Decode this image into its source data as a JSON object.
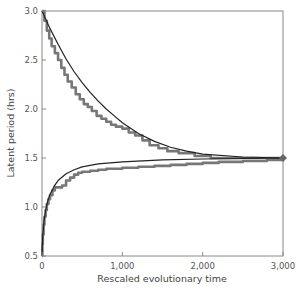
{
  "chart_data": {
    "type": "line",
    "title": "",
    "xlabel": "Rescaled evolutionary time",
    "ylabel": "Latent period (hrs)",
    "xlim": [
      0,
      3000
    ],
    "ylim": [
      0.5,
      3.0
    ],
    "grid": false,
    "legend": null,
    "x_ticks": [
      0,
      1000,
      2000,
      3000
    ],
    "x_tick_labels": [
      "0",
      "1,000",
      "2,000",
      "3,000"
    ],
    "y_ticks": [
      0.5,
      1.0,
      1.5,
      2.0,
      2.5,
      3.0
    ],
    "y_tick_labels": [
      "0.5",
      "1.0",
      "1.5",
      "2.0",
      "2.5",
      "3.0"
    ],
    "series": [
      {
        "name": "Simulation (decreasing from 3.0)",
        "style": "step",
        "color": "#777777",
        "x": [
          0,
          30,
          60,
          90,
          120,
          160,
          200,
          240,
          280,
          320,
          370,
          420,
          470,
          520,
          570,
          620,
          680,
          740,
          800,
          860,
          920,
          1000,
          1080,
          1160,
          1250,
          1340,
          1450,
          1560,
          1700,
          1900,
          2100,
          2400,
          2700,
          3000
        ],
        "y": [
          3.0,
          2.9,
          2.8,
          2.72,
          2.64,
          2.57,
          2.5,
          2.42,
          2.35,
          2.28,
          2.22,
          2.15,
          2.1,
          2.05,
          2.02,
          1.98,
          1.93,
          1.9,
          1.87,
          1.84,
          1.82,
          1.8,
          1.76,
          1.73,
          1.68,
          1.63,
          1.6,
          1.57,
          1.55,
          1.52,
          1.5,
          1.5,
          1.5,
          1.5
        ]
      },
      {
        "name": "Theory (decreasing)",
        "style": "smooth",
        "color": "#222222",
        "x": [
          0,
          100,
          200,
          300,
          400,
          500,
          600,
          700,
          800,
          900,
          1000,
          1200,
          1400,
          1600,
          1800,
          2000,
          2500,
          3000
        ],
        "y": [
          3.0,
          2.82,
          2.66,
          2.51,
          2.38,
          2.27,
          2.17,
          2.08,
          2.0,
          1.93,
          1.86,
          1.75,
          1.67,
          1.61,
          1.57,
          1.54,
          1.51,
          1.5
        ]
      },
      {
        "name": "Simulation (increasing from 0.5)",
        "style": "step",
        "color": "#777777",
        "x": [
          0,
          5,
          10,
          20,
          30,
          45,
          60,
          80,
          100,
          130,
          160,
          200,
          250,
          300,
          350,
          400,
          450,
          500,
          600,
          700,
          800,
          1000,
          1200,
          1400,
          1600,
          1800,
          2000,
          2200,
          2500,
          2800,
          3000
        ],
        "y": [
          0.5,
          0.62,
          0.72,
          0.82,
          0.9,
          0.97,
          1.03,
          1.08,
          1.12,
          1.17,
          1.2,
          1.2,
          1.22,
          1.27,
          1.3,
          1.33,
          1.35,
          1.36,
          1.37,
          1.38,
          1.39,
          1.4,
          1.41,
          1.42,
          1.43,
          1.44,
          1.45,
          1.46,
          1.47,
          1.48,
          1.5
        ]
      },
      {
        "name": "Theory (increasing)",
        "style": "smooth",
        "color": "#222222",
        "x": [
          0,
          10,
          25,
          50,
          75,
          100,
          150,
          200,
          300,
          400,
          500,
          700,
          1000,
          1500,
          2000,
          2500,
          3000
        ],
        "y": [
          0.5,
          0.72,
          0.86,
          0.99,
          1.07,
          1.13,
          1.21,
          1.27,
          1.34,
          1.38,
          1.41,
          1.44,
          1.46,
          1.48,
          1.49,
          1.495,
          1.5
        ]
      }
    ],
    "annotations": [
      {
        "type": "marker",
        "shape": "diamond",
        "x": 3000,
        "y": 1.5,
        "color": "#666666"
      }
    ]
  }
}
